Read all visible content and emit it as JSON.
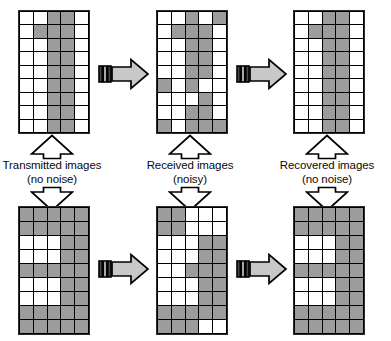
{
  "figure": {
    "grid": {
      "columns": 5,
      "rows": 9
    },
    "colors": {
      "pixel_on": "#9c9c9c",
      "pixel_off": "#ffffff",
      "grid_line": "#000000",
      "arrow_fill": "#c8c8c8",
      "arrow_outline": "#000000",
      "background": "#ffffff",
      "text": "#0a0a0a"
    }
  },
  "captions": [
    {
      "line1": "Transmitted images",
      "line2": "(no noise)"
    },
    {
      "line1": "Received images",
      "line2": "(noisy)"
    },
    {
      "line1": "Recovered images",
      "line2": "(no noise)"
    }
  ],
  "arrows": {
    "right_label": "channel-transmission",
    "up_label": "points-to-caption"
  },
  "chart_data": {
    "type": "heatmap",
    "xlabel": "",
    "ylabel": "",
    "legend": [
      "0 = white pixel",
      "1 = gray pixel"
    ],
    "panels": [
      {
        "name": "transmitted-digit-one",
        "caption": "Transmitted images (no noise)",
        "row": 0,
        "column": 0,
        "matrix": [
          [
            0,
            0,
            1,
            1,
            0
          ],
          [
            0,
            1,
            1,
            1,
            0
          ],
          [
            0,
            0,
            1,
            1,
            0
          ],
          [
            0,
            0,
            1,
            1,
            0
          ],
          [
            0,
            0,
            1,
            1,
            0
          ],
          [
            0,
            0,
            1,
            1,
            0
          ],
          [
            0,
            0,
            1,
            1,
            0
          ],
          [
            0,
            0,
            1,
            1,
            0
          ],
          [
            0,
            0,
            1,
            1,
            0
          ]
        ]
      },
      {
        "name": "received-digit-one",
        "caption": "Received images (noisy)",
        "row": 0,
        "column": 1,
        "matrix": [
          [
            0,
            0,
            1,
            0,
            1
          ],
          [
            0,
            1,
            1,
            1,
            0
          ],
          [
            0,
            0,
            1,
            1,
            0
          ],
          [
            0,
            0,
            1,
            1,
            0
          ],
          [
            0,
            0,
            1,
            1,
            0
          ],
          [
            1,
            0,
            1,
            0,
            0
          ],
          [
            0,
            0,
            0,
            1,
            0
          ],
          [
            0,
            0,
            1,
            1,
            0
          ],
          [
            1,
            0,
            1,
            1,
            1
          ]
        ]
      },
      {
        "name": "recovered-digit-one",
        "caption": "Recovered images (no noise)",
        "row": 0,
        "column": 2,
        "matrix": [
          [
            0,
            0,
            1,
            1,
            0
          ],
          [
            0,
            1,
            1,
            1,
            0
          ],
          [
            0,
            0,
            1,
            1,
            0
          ],
          [
            0,
            0,
            1,
            1,
            0
          ],
          [
            0,
            0,
            1,
            1,
            0
          ],
          [
            0,
            0,
            1,
            1,
            0
          ],
          [
            0,
            0,
            1,
            1,
            0
          ],
          [
            0,
            0,
            1,
            1,
            0
          ],
          [
            0,
            0,
            1,
            1,
            0
          ]
        ]
      },
      {
        "name": "transmitted-digit-three",
        "caption": "Transmitted images (no noise)",
        "row": 1,
        "column": 0,
        "matrix": [
          [
            1,
            1,
            1,
            1,
            1
          ],
          [
            1,
            1,
            1,
            1,
            1
          ],
          [
            0,
            0,
            0,
            1,
            1
          ],
          [
            0,
            0,
            0,
            1,
            1
          ],
          [
            1,
            1,
            1,
            1,
            1
          ],
          [
            0,
            0,
            0,
            1,
            1
          ],
          [
            0,
            0,
            0,
            1,
            1
          ],
          [
            1,
            1,
            1,
            1,
            1
          ],
          [
            1,
            1,
            1,
            1,
            1
          ]
        ]
      },
      {
        "name": "received-digit-three",
        "caption": "Received images (noisy)",
        "row": 1,
        "column": 1,
        "matrix": [
          [
            1,
            1,
            0,
            0,
            0
          ],
          [
            1,
            1,
            0,
            0,
            0
          ],
          [
            0,
            0,
            0,
            1,
            1
          ],
          [
            0,
            0,
            0,
            1,
            1
          ],
          [
            0,
            0,
            1,
            1,
            1
          ],
          [
            0,
            0,
            0,
            1,
            1
          ],
          [
            0,
            0,
            0,
            1,
            1
          ],
          [
            1,
            1,
            1,
            1,
            1
          ],
          [
            1,
            1,
            1,
            0,
            0
          ]
        ]
      },
      {
        "name": "recovered-digit-three",
        "caption": "Recovered images (no noise)",
        "row": 1,
        "column": 2,
        "matrix": [
          [
            1,
            1,
            1,
            1,
            1
          ],
          [
            1,
            1,
            1,
            1,
            1
          ],
          [
            0,
            0,
            0,
            1,
            1
          ],
          [
            0,
            0,
            0,
            1,
            1
          ],
          [
            1,
            1,
            1,
            1,
            1
          ],
          [
            0,
            0,
            0,
            1,
            1
          ],
          [
            0,
            0,
            0,
            1,
            1
          ],
          [
            1,
            1,
            1,
            1,
            1
          ],
          [
            1,
            1,
            1,
            1,
            1
          ]
        ]
      }
    ]
  }
}
